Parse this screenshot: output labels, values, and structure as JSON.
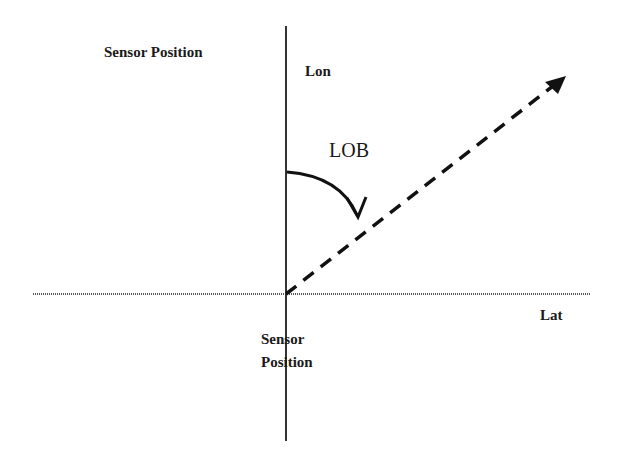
{
  "labels": {
    "sensor_position_top": "Sensor Position",
    "lon": "Lon",
    "lob": "LOB",
    "lat": "Lat",
    "sensor_position_bottom_line1": "Sensor",
    "sensor_position_bottom_line2": "Position"
  },
  "colors": {
    "ink": "#1a1a1a",
    "axis": "#555555",
    "background": "#ffffff"
  }
}
